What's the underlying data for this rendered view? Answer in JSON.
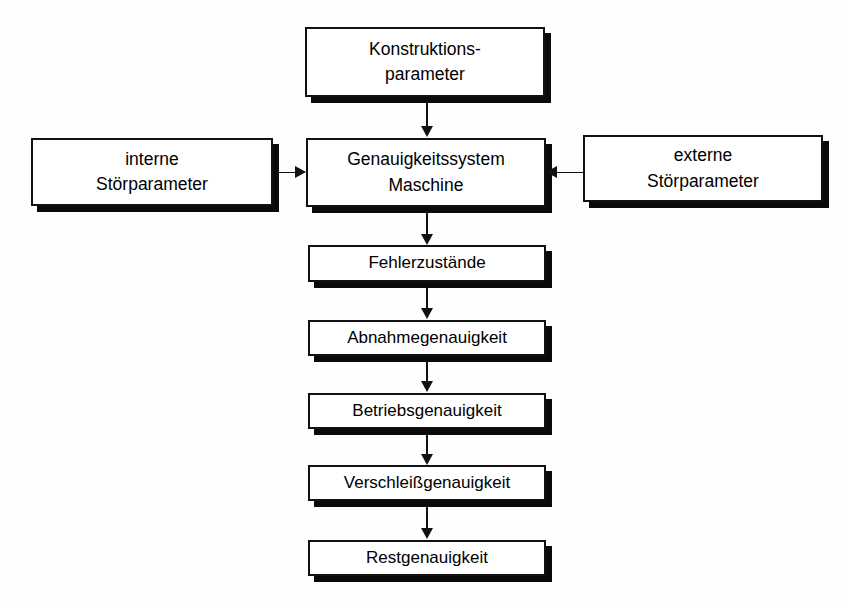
{
  "diagram": {
    "colors": {
      "background": "#fefefe",
      "box_fill": "#ffffff",
      "box_border": "#111111",
      "shadow": "#0a0a0a",
      "text": "#000000",
      "connector": "#111111"
    },
    "nodes": {
      "konstruktionsparameter": {
        "line1": "Konstruktions-",
        "line2": "parameter"
      },
      "genauigkeitssystem": {
        "line1": "Genauigkeitssystem",
        "line2": "Maschine"
      },
      "interne_stoerparameter": {
        "line1": "interne",
        "line2": "Störparameter"
      },
      "externe_stoerparameter": {
        "line1": "externe",
        "line2": "Störparameter"
      },
      "fehlerzustaende": {
        "line1": "Fehlerzustände"
      },
      "abnahmegenauigkeit": {
        "line1": "Abnahmegenauigkeit"
      },
      "betriebsgenauigkeit": {
        "line1": "Betriebsgenauigkeit"
      },
      "verschleissgenauigkeit": {
        "line1": "Verschleißgenauigkeit"
      },
      "restgenauigkeit": {
        "line1": "Restgenauigkeit"
      }
    },
    "connectors": [
      {
        "name": "konstruktionsparameter-to-genauigkeitssystem",
        "direction": "down"
      },
      {
        "name": "interne-stoerparameter-to-genauigkeitssystem",
        "direction": "right"
      },
      {
        "name": "externe-stoerparameter-to-genauigkeitssystem",
        "direction": "left"
      },
      {
        "name": "genauigkeitssystem-to-fehlerzustaende",
        "direction": "down"
      },
      {
        "name": "fehlerzustaende-to-abnahmegenauigkeit",
        "direction": "down"
      },
      {
        "name": "abnahmegenauigkeit-to-betriebsgenauigkeit",
        "direction": "down"
      },
      {
        "name": "betriebsgenauigkeit-to-verschleissgenauigkeit",
        "direction": "down"
      },
      {
        "name": "verschleissgenauigkeit-to-restgenauigkeit",
        "direction": "down"
      }
    ]
  }
}
